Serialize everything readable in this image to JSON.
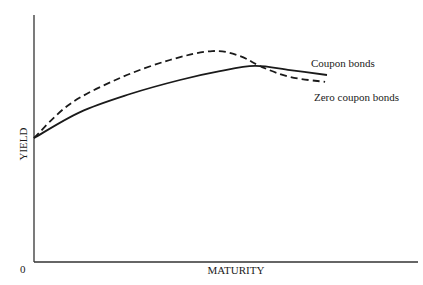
{
  "chart_data": {
    "type": "line",
    "title": "",
    "xlabel": "MATURITY",
    "ylabel": "YIELD",
    "origin_label": "0",
    "xlim": [
      0,
      10
    ],
    "ylim": [
      0,
      10
    ],
    "grid": false,
    "units_note": "Conceptual diagram without numeric ticks; values in relative units",
    "series": [
      {
        "name": "Coupon bonds",
        "style": "solid",
        "color": "#1a1a1a",
        "x": [
          0,
          1.2,
          2.5,
          3.8,
          4.84,
          5.75,
          6.67,
          7.63
        ],
        "y": [
          5.02,
          6.07,
          6.8,
          7.37,
          7.73,
          7.94,
          7.77,
          7.57
        ]
      },
      {
        "name": "Zero coupon bonds",
        "style": "dashed",
        "color": "#1a1a1a",
        "x": [
          0,
          0.94,
          2.24,
          3.54,
          4.64,
          5.36,
          5.94,
          6.67,
          7.58
        ],
        "y": [
          5.02,
          6.4,
          7.45,
          8.18,
          8.54,
          8.34,
          7.89,
          7.49,
          7.29
        ]
      }
    ],
    "annotations": [
      {
        "text": "Coupon bonds",
        "series": "Coupon bonds"
      },
      {
        "text": "Zero coupon bonds",
        "series": "Zero coupon bonds"
      }
    ]
  }
}
